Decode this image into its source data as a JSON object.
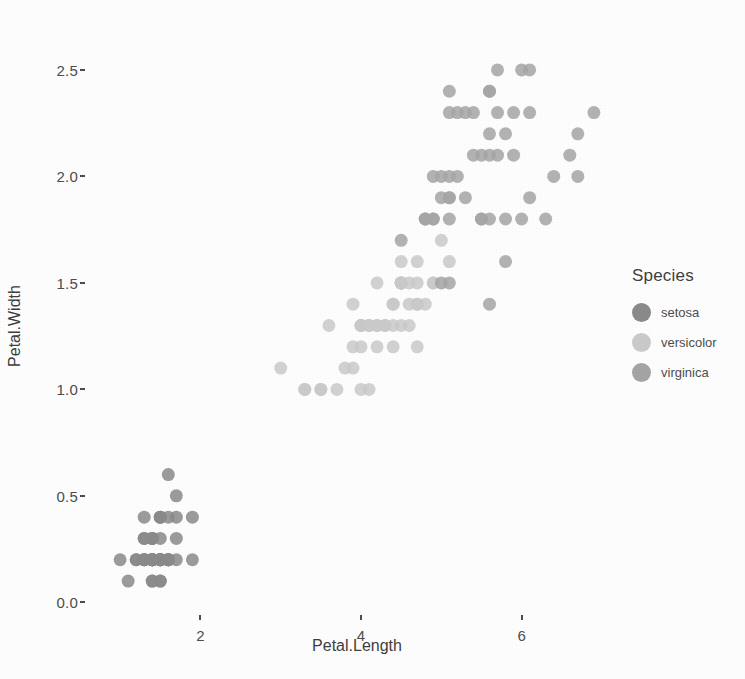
{
  "chart_data": {
    "type": "scatter",
    "title": "",
    "xlabel": "Petal.Length",
    "ylabel": "Petal.Width",
    "xlim": [
      0.6,
      7.3
    ],
    "ylim": [
      -0.05,
      2.65
    ],
    "xticks": [
      "2",
      "4",
      "6"
    ],
    "xtick_values": [
      2,
      4,
      6
    ],
    "yticks": [
      "0.0",
      "0.5",
      "1.0",
      "1.5",
      "2.0",
      "2.5"
    ],
    "ytick_values": [
      0.0,
      0.5,
      1.0,
      1.5,
      2.0,
      2.5
    ],
    "grid": false,
    "legend_position": "right",
    "legend_title": "Species",
    "point_size": 13,
    "point_opacity": 0.85,
    "series": [
      {
        "name": "setosa",
        "color": "#8a8a8a",
        "x": [
          1.4,
          1.4,
          1.3,
          1.5,
          1.4,
          1.7,
          1.4,
          1.5,
          1.4,
          1.5,
          1.5,
          1.6,
          1.4,
          1.1,
          1.2,
          1.5,
          1.3,
          1.4,
          1.7,
          1.5,
          1.7,
          1.5,
          1.0,
          1.7,
          1.9,
          1.6,
          1.6,
          1.5,
          1.4,
          1.6,
          1.6,
          1.5,
          1.5,
          1.4,
          1.5,
          1.2,
          1.3,
          1.4,
          1.3,
          1.5,
          1.3,
          1.3,
          1.3,
          1.6,
          1.9,
          1.4,
          1.6,
          1.4,
          1.5,
          1.4
        ],
        "y": [
          0.2,
          0.2,
          0.2,
          0.2,
          0.2,
          0.4,
          0.3,
          0.2,
          0.2,
          0.1,
          0.2,
          0.2,
          0.1,
          0.1,
          0.2,
          0.4,
          0.4,
          0.3,
          0.3,
          0.3,
          0.2,
          0.4,
          0.2,
          0.5,
          0.2,
          0.2,
          0.4,
          0.2,
          0.2,
          0.2,
          0.2,
          0.4,
          0.1,
          0.2,
          0.2,
          0.2,
          0.2,
          0.1,
          0.2,
          0.2,
          0.3,
          0.3,
          0.2,
          0.6,
          0.4,
          0.3,
          0.2,
          0.2,
          0.2,
          0.2
        ]
      },
      {
        "name": "versicolor",
        "color": "#c9c9c9",
        "x": [
          4.7,
          4.5,
          4.9,
          4.0,
          4.6,
          4.5,
          4.7,
          3.3,
          4.6,
          3.9,
          3.5,
          4.2,
          4.0,
          4.7,
          3.6,
          4.4,
          4.5,
          4.1,
          4.5,
          3.9,
          4.8,
          4.0,
          4.9,
          4.7,
          4.3,
          4.4,
          4.8,
          5.0,
          4.5,
          3.5,
          3.8,
          3.7,
          3.9,
          5.1,
          4.5,
          4.5,
          4.7,
          4.4,
          4.1,
          4.0,
          4.4,
          4.6,
          4.0,
          3.3,
          4.2,
          4.2,
          4.2,
          4.3,
          3.0,
          4.1
        ],
        "y": [
          1.4,
          1.5,
          1.5,
          1.3,
          1.5,
          1.3,
          1.6,
          1.0,
          1.3,
          1.4,
          1.0,
          1.5,
          1.0,
          1.4,
          1.3,
          1.4,
          1.5,
          1.0,
          1.5,
          1.1,
          1.8,
          1.3,
          1.5,
          1.2,
          1.3,
          1.4,
          1.4,
          1.7,
          1.5,
          1.0,
          1.1,
          1.0,
          1.2,
          1.6,
          1.5,
          1.6,
          1.5,
          1.3,
          1.3,
          1.3,
          1.2,
          1.4,
          1.2,
          1.0,
          1.3,
          1.2,
          1.3,
          1.3,
          1.1,
          1.3
        ]
      },
      {
        "name": "virginica",
        "color": "#a4a4a4",
        "x": [
          6.0,
          5.1,
          5.9,
          5.6,
          5.8,
          6.6,
          4.5,
          6.3,
          5.8,
          6.1,
          5.1,
          5.3,
          5.5,
          5.0,
          5.1,
          5.3,
          5.5,
          6.7,
          6.9,
          5.0,
          5.7,
          4.9,
          6.7,
          4.9,
          5.7,
          6.0,
          4.8,
          4.9,
          5.6,
          5.8,
          6.1,
          6.4,
          5.6,
          5.1,
          5.6,
          6.1,
          5.6,
          5.5,
          4.8,
          5.4,
          5.6,
          5.1,
          5.1,
          5.9,
          5.7,
          5.2,
          5.0,
          5.2,
          5.4,
          5.1
        ],
        "y": [
          2.5,
          1.9,
          2.1,
          1.8,
          2.2,
          2.1,
          1.7,
          1.8,
          1.8,
          2.5,
          2.0,
          1.9,
          2.1,
          2.0,
          2.4,
          2.3,
          1.8,
          2.2,
          2.3,
          1.5,
          2.3,
          2.0,
          2.0,
          1.8,
          2.1,
          1.8,
          1.8,
          1.8,
          2.1,
          1.6,
          1.9,
          2.0,
          2.2,
          1.5,
          1.4,
          2.3,
          2.4,
          1.8,
          1.8,
          2.1,
          2.4,
          2.3,
          1.9,
          2.3,
          2.5,
          2.3,
          1.9,
          2.0,
          2.3,
          1.8
        ]
      }
    ]
  },
  "axes": {
    "x_title": "Petal.Length",
    "y_title": "Petal.Width"
  },
  "legend": {
    "title": "Species",
    "items": [
      {
        "label": "setosa",
        "color": "#8a8a8a"
      },
      {
        "label": "versicolor",
        "color": "#c9c9c9"
      },
      {
        "label": "virginica",
        "color": "#a4a4a4"
      }
    ]
  }
}
